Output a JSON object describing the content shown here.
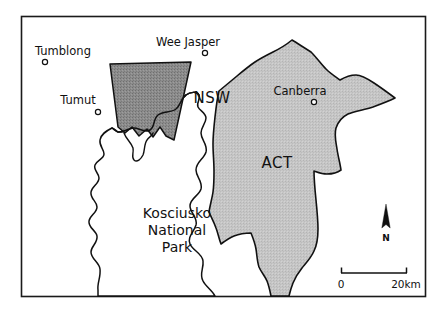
{
  "map": {
    "frame": {
      "border_color": "#1a1a1a"
    },
    "background_color": "#ffffff",
    "regions": [
      {
        "id": "state-forest-block",
        "label": "",
        "fill_color": "#8c8c8c",
        "stroke_color": "#111111"
      },
      {
        "id": "kosciusko-national-park",
        "label": "Kosciusko National Park",
        "fill_color": "#ffffff",
        "stroke_color": "#111111"
      },
      {
        "id": "australian-capital-territory",
        "label": "ACT",
        "fill_color": "#c4c4c4",
        "stroke_color": "#111111"
      }
    ],
    "region_labels": {
      "nsw": "NSW",
      "act": "ACT",
      "park_line1": "Kosciusko",
      "park_line2": "National",
      "park_line3": "Park"
    },
    "places": [
      {
        "name": "Tumblong",
        "label_x": 63,
        "label_y": 51,
        "marker_x": 45,
        "marker_y": 62,
        "anchor": "middle"
      },
      {
        "name": "Wee Jasper",
        "label_x": 188,
        "label_y": 42,
        "marker_x": 205,
        "marker_y": 53,
        "anchor": "middle"
      },
      {
        "name": "Tumut",
        "label_x": 78,
        "label_y": 100,
        "marker_x": 98,
        "marker_y": 112,
        "anchor": "middle"
      },
      {
        "name": "Canberra",
        "label_x": 300,
        "label_y": 91,
        "marker_x": 314,
        "marker_y": 102,
        "anchor": "middle"
      }
    ],
    "scale_bar": {
      "start_label": "0",
      "end_label": "20km"
    },
    "compass": {
      "label": "N"
    }
  }
}
